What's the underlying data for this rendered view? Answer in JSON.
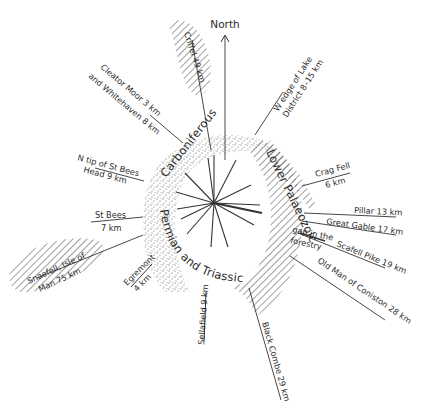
{
  "diagram": {
    "north_label": "North",
    "centre": {
      "x": 214,
      "y": 203
    },
    "colors": {
      "ink": "#2b2b2b",
      "background": "#ffffff",
      "stipple": "#555555",
      "hatch": "#444444"
    },
    "geology": {
      "carboniferous": "Carboniferous",
      "lower_palaeozoic": "Lower Palaeozoic",
      "permian_triassic": "Permian and Triassic"
    },
    "sightlines": [
      {
        "id": "criffel",
        "label": "Criffel 49 km",
        "hatched": true
      },
      {
        "id": "cleator-moor",
        "label_line1": "Cleator Moor  3 km",
        "label_line2": "and Whitehaven  8 km"
      },
      {
        "id": "w-edge",
        "label_line1": "W edge of Lake",
        "label_line2": "District 8–15 km"
      },
      {
        "id": "n-tip-st-bees",
        "label_line1": "N tip of St Bees",
        "label_line2": "Head 9 km"
      },
      {
        "id": "crag-fell",
        "label_line1": "Crag Fell",
        "label_line2": "6 km"
      },
      {
        "id": "st-bees",
        "label_line1": "St Bees",
        "label_line2": "7 km"
      },
      {
        "id": "pillar",
        "label": "Pillar 13 km"
      },
      {
        "id": "great-gable",
        "label": "Great Gable 17 km"
      },
      {
        "id": "scafell-pike",
        "label": "Scafell Pike 19 km"
      },
      {
        "id": "gap-forestry",
        "label_line1": "gap in the",
        "label_line2": "forestry"
      },
      {
        "id": "snaefell",
        "label_line1": "Snaefell, Isle of",
        "label_line2": "Man 75 km",
        "hatched": true
      },
      {
        "id": "egremont",
        "label_line1": "Egremont",
        "label_line2": "4 km"
      },
      {
        "id": "old-man-coniston",
        "label": "Old Man of Coniston  28 km"
      },
      {
        "id": "sellafield",
        "label": "Sellafield 9 km"
      },
      {
        "id": "black-combe",
        "label": "Black Combe 29 km"
      }
    ]
  }
}
